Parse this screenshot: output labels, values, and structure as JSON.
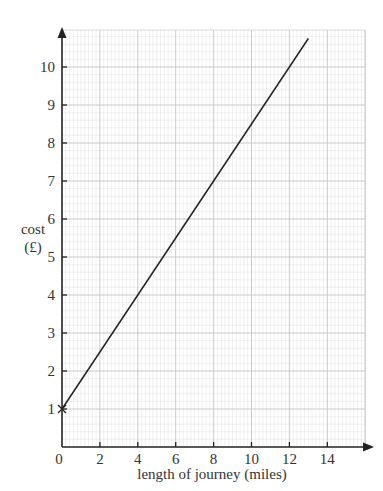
{
  "chart_data": {
    "type": "line",
    "title": "",
    "xlabel": "length of journey (miles)",
    "ylabel": "cost (£)",
    "ylabel_lines": [
      "cost",
      "(£)"
    ],
    "xlim": [
      0,
      15.5
    ],
    "ylim": [
      0,
      10.7
    ],
    "xticks": [
      0,
      2,
      4,
      6,
      8,
      10,
      12,
      14
    ],
    "yticks": [
      1,
      2,
      3,
      4,
      5,
      6,
      7,
      8,
      9,
      10
    ],
    "grid": true,
    "minor_grid_step": 0.2,
    "series": [
      {
        "name": "cost",
        "x": [
          0,
          13
        ],
        "y": [
          1,
          10.75
        ],
        "color": "#222222"
      }
    ],
    "annotations": [
      {
        "type": "cross-marker",
        "x": 0,
        "y": 1
      }
    ]
  }
}
